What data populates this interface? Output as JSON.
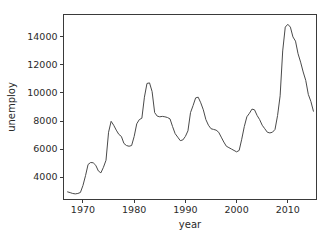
{
  "chart_data": {
    "type": "line",
    "title": "",
    "xlabel": "year",
    "ylabel": "unemploy",
    "xlim": [
      1966.2,
      1916.0
    ],
    "x_range": [
      1966.2,
      2015.6
    ],
    "ylim": [
      2400,
      15600
    ],
    "grid": false,
    "legend": "none",
    "line_color": "#4a4a4a",
    "background_color": "#ffffff",
    "axis_color": "#3a3a3a",
    "xticks": [
      1970,
      1980,
      1990,
      2000,
      2010
    ],
    "xtick_labels": [
      "1970",
      "1980",
      "1990",
      "2000",
      "2010"
    ],
    "yticks": [
      4000,
      6000,
      8000,
      10000,
      12000,
      14000
    ],
    "ytick_labels": [
      "4000",
      "6000",
      "8000",
      "10000",
      "12000",
      "14000"
    ],
    "series": [
      {
        "name": "unemploy",
        "x": [
          1967.0,
          1967.5,
          1968.0,
          1968.5,
          1969.0,
          1969.5,
          1970.0,
          1970.5,
          1971.0,
          1971.5,
          1972.0,
          1972.5,
          1973.0,
          1973.5,
          1974.0,
          1974.5,
          1975.0,
          1975.5,
          1976.0,
          1976.5,
          1977.0,
          1977.5,
          1978.0,
          1978.5,
          1979.0,
          1979.5,
          1980.0,
          1980.5,
          1981.0,
          1981.5,
          1982.0,
          1982.5,
          1983.0,
          1983.5,
          1984.0,
          1984.5,
          1985.0,
          1985.5,
          1986.0,
          1986.5,
          1987.0,
          1987.5,
          1988.0,
          1988.5,
          1989.0,
          1989.5,
          1990.0,
          1990.5,
          1991.0,
          1991.5,
          1992.0,
          1992.5,
          1993.0,
          1993.5,
          1994.0,
          1994.5,
          1995.0,
          1995.5,
          1996.0,
          1996.5,
          1997.0,
          1997.5,
          1998.0,
          1998.5,
          1999.0,
          1999.5,
          2000.0,
          2000.5,
          2001.0,
          2001.5,
          2002.0,
          2002.5,
          2003.0,
          2003.5,
          2004.0,
          2004.5,
          2005.0,
          2005.5,
          2006.0,
          2006.5,
          2007.0,
          2007.5,
          2008.0,
          2008.5,
          2009.0,
          2009.5,
          2010.0,
          2010.5,
          2011.0,
          2011.5,
          2012.0,
          2012.5,
          2013.0,
          2013.5,
          2014.0,
          2014.5,
          2015.0
        ],
        "values": [
          2944,
          2890,
          2830,
          2800,
          2830,
          2900,
          3400,
          4100,
          4900,
          5040,
          5020,
          4840,
          4440,
          4300,
          4700,
          5200,
          7200,
          7980,
          7700,
          7350,
          7050,
          6900,
          6400,
          6250,
          6200,
          6250,
          6900,
          7800,
          8100,
          8200,
          9700,
          10680,
          10720,
          10100,
          8600,
          8350,
          8300,
          8330,
          8300,
          8250,
          8150,
          7600,
          7100,
          6850,
          6600,
          6650,
          6900,
          7300,
          8600,
          9100,
          9650,
          9700,
          9300,
          8800,
          8100,
          7700,
          7450,
          7400,
          7350,
          7200,
          6850,
          6500,
          6200,
          6100,
          6000,
          5900,
          5800,
          5900,
          6700,
          7600,
          8300,
          8550,
          8850,
          8800,
          8400,
          8100,
          7700,
          7450,
          7200,
          7150,
          7200,
          7400,
          8400,
          9800,
          13000,
          14700,
          14900,
          14700,
          14000,
          13700,
          12800,
          12200,
          11500,
          10900,
          9900,
          9400,
          8700
        ]
      }
    ]
  }
}
